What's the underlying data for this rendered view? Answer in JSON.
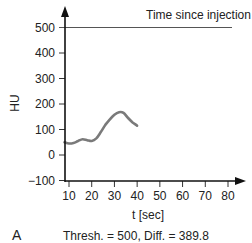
{
  "chart_data": {
    "type": "line",
    "title": "Time since injection = 41 sec",
    "xlabel": "t [sec]",
    "ylabel": "HU",
    "xlim": [
      7,
      88
    ],
    "ylim": [
      -100,
      560
    ],
    "x_ticks": [
      10,
      20,
      30,
      40,
      50,
      60,
      70,
      80
    ],
    "y_ticks": [
      -100,
      0,
      100,
      200,
      300,
      400,
      500
    ],
    "threshold_line": {
      "y": 500
    },
    "series": [
      {
        "name": "time-density curve",
        "color": "#7a7a7a",
        "x": [
          8,
          10,
          12,
          14,
          16,
          18,
          20,
          22,
          24,
          26,
          28,
          30,
          32,
          34,
          36,
          38,
          40
        ],
        "y": [
          50,
          45,
          47,
          55,
          62,
          58,
          55,
          65,
          90,
          118,
          140,
          158,
          168,
          165,
          145,
          128,
          115
        ]
      }
    ],
    "panel_label": "A",
    "caption": "Thresh. = 500, Diff. = 389.8"
  },
  "labels": {
    "title": "Time since injection = 41 sec",
    "xlabel": "t [sec]",
    "ylabel": "HU",
    "panel": "A",
    "caption": "Thresh. = 500, Diff. = 389.8"
  }
}
